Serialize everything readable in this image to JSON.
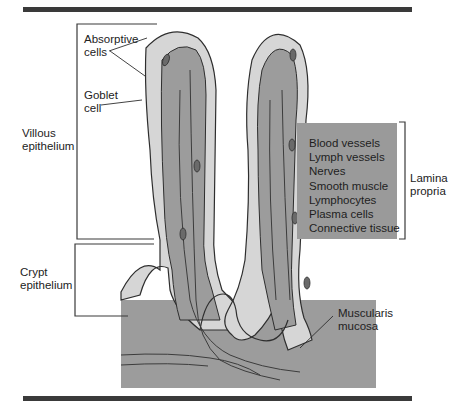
{
  "figure": {
    "type": "anatomical-diagram"
  },
  "labels": {
    "absorptive_cells": [
      "Absorptive",
      "cells"
    ],
    "goblet_cell": [
      "Goblet",
      "cell"
    ],
    "villous_epithelium": [
      "Villous",
      "epithelium"
    ],
    "crypt_epithelium": [
      "Crypt",
      "epithelium"
    ],
    "lamina_propria": [
      "Lamina",
      "propria"
    ],
    "muscularis_mucosa": [
      "Muscularis",
      "mucosa"
    ]
  },
  "lamina_propria_contents": [
    "Blood vessels",
    "Lymph vessels",
    "Nerves",
    "Smooth muscle",
    "Lymphocytes",
    "Plasma cells",
    "Connective tissue"
  ],
  "colors": {
    "tissue": "#9c9c9c",
    "epithelium": "#d6d6d6",
    "outline": "#2e2e2e",
    "box": "#9a9a9a",
    "rule": "#3a3a3a"
  }
}
